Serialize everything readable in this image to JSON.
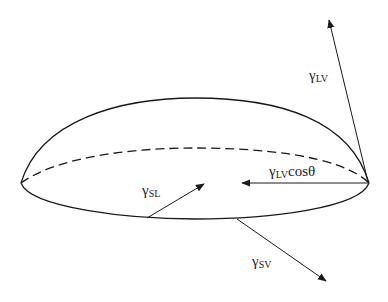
{
  "diagram": {
    "colors": {
      "stroke": "#1a1a1a",
      "text": "#222222",
      "background": "#ffffff"
    },
    "labels": {
      "gamma_lv": {
        "symbol": "γ",
        "subscript": "LV",
        "suffix": ""
      },
      "gamma_lv_cos": {
        "symbol": "γ",
        "subscript": "LV",
        "suffix": "cosθ"
      },
      "gamma_sl": {
        "symbol": "γ",
        "subscript": "SL",
        "suffix": ""
      },
      "gamma_sv": {
        "symbol": "γ",
        "subscript": "SV",
        "suffix": ""
      }
    }
  }
}
